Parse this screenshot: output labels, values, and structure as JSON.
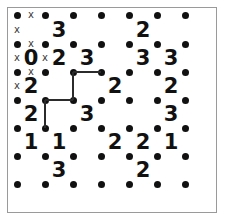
{
  "puzzle": {
    "name": "slitherlink",
    "grid_cols": 6,
    "grid_rows": 6,
    "dot_cols": 7,
    "dot_rows": 7,
    "colors": {
      "dot": "#111111",
      "clue": "#111111",
      "cross": "#3a3a3a",
      "edge": "#2b2b2b",
      "frame": "#9a9a9a",
      "background": "#ffffff"
    },
    "geometry": {
      "dot_x": [
        17,
        45,
        73,
        101,
        129,
        157,
        185
      ],
      "dot_y": [
        15,
        44,
        72,
        100,
        128,
        156,
        184
      ]
    },
    "clue_rows": [
      [
        "",
        "3",
        "",
        "",
        "2",
        ""
      ],
      [
        "0",
        "2",
        "3",
        "",
        "3",
        "3"
      ],
      [
        "2",
        "",
        "",
        "2",
        "",
        "2"
      ],
      [
        "2",
        "",
        "3",
        "",
        "",
        "3"
      ],
      [
        "1",
        "1",
        "",
        "2",
        "2",
        "1"
      ],
      [
        "",
        "3",
        "",
        "",
        "2",
        ""
      ]
    ],
    "clues": [
      {
        "row": 0,
        "col": 1,
        "value": "3"
      },
      {
        "row": 0,
        "col": 4,
        "value": "2"
      },
      {
        "row": 1,
        "col": 0,
        "value": "0"
      },
      {
        "row": 1,
        "col": 1,
        "value": "2"
      },
      {
        "row": 1,
        "col": 2,
        "value": "3"
      },
      {
        "row": 1,
        "col": 4,
        "value": "3"
      },
      {
        "row": 1,
        "col": 5,
        "value": "3"
      },
      {
        "row": 2,
        "col": 0,
        "value": "2"
      },
      {
        "row": 2,
        "col": 3,
        "value": "2"
      },
      {
        "row": 2,
        "col": 5,
        "value": "2"
      },
      {
        "row": 3,
        "col": 0,
        "value": "2"
      },
      {
        "row": 3,
        "col": 2,
        "value": "3"
      },
      {
        "row": 3,
        "col": 5,
        "value": "3"
      },
      {
        "row": 4,
        "col": 0,
        "value": "1"
      },
      {
        "row": 4,
        "col": 1,
        "value": "1"
      },
      {
        "row": 4,
        "col": 3,
        "value": "2"
      },
      {
        "row": 4,
        "col": 4,
        "value": "2"
      },
      {
        "row": 4,
        "col": 5,
        "value": "1"
      },
      {
        "row": 5,
        "col": 1,
        "value": "3"
      },
      {
        "row": 5,
        "col": 4,
        "value": "2"
      }
    ],
    "crosses": [
      {
        "orientation": "horizontal",
        "row": 0,
        "col": 0,
        "glyph": "x"
      },
      {
        "orientation": "vertical",
        "row": 0,
        "col": 0,
        "glyph": "x"
      },
      {
        "orientation": "horizontal",
        "row": 1,
        "col": 0,
        "glyph": "x"
      },
      {
        "orientation": "vertical",
        "row": 1,
        "col": 0,
        "glyph": "x"
      },
      {
        "orientation": "vertical",
        "row": 1,
        "col": 1,
        "glyph": "x"
      },
      {
        "orientation": "horizontal",
        "row": 2,
        "col": 0,
        "glyph": "x"
      },
      {
        "orientation": "vertical",
        "row": 2,
        "col": 0,
        "glyph": "x"
      }
    ],
    "edges": [
      {
        "orientation": "horizontal",
        "row": 2,
        "col": 2
      },
      {
        "orientation": "vertical",
        "row": 2,
        "col": 2
      },
      {
        "orientation": "horizontal",
        "row": 3,
        "col": 1
      },
      {
        "orientation": "vertical",
        "row": 3,
        "col": 1
      }
    ],
    "edge_count": 4,
    "cross_count": 7,
    "clue_count": 20
  }
}
